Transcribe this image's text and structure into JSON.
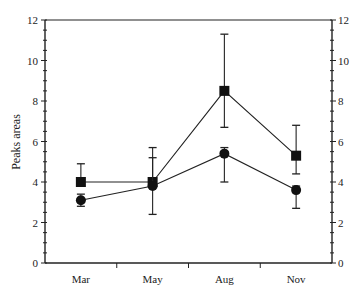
{
  "chart_data": {
    "type": "line",
    "title": "",
    "xlabel": "",
    "ylabel": "Peaks areas",
    "ylabel_right": "",
    "categories": [
      "Mar",
      "May",
      "Aug",
      "Nov"
    ],
    "ylim": [
      0,
      12
    ],
    "yticks": [
      0,
      2,
      4,
      6,
      8,
      10,
      12
    ],
    "yticks_right": [
      0,
      2,
      4,
      6,
      8,
      10,
      12
    ],
    "grid": false,
    "legend": "none",
    "series": [
      {
        "name": "square-series",
        "marker": "square",
        "values": [
          4.0,
          4.0,
          8.5,
          5.3
        ],
        "error_upper": [
          4.9,
          5.7,
          11.3,
          6.8
        ],
        "error_lower": [
          4.0,
          4.0,
          6.7,
          4.4
        ]
      },
      {
        "name": "circle-series",
        "marker": "circle",
        "values": [
          3.1,
          3.8,
          5.4,
          3.6
        ],
        "error_upper": [
          3.4,
          5.2,
          5.7,
          3.8
        ],
        "error_lower": [
          2.8,
          2.4,
          4.0,
          2.7
        ]
      }
    ]
  }
}
